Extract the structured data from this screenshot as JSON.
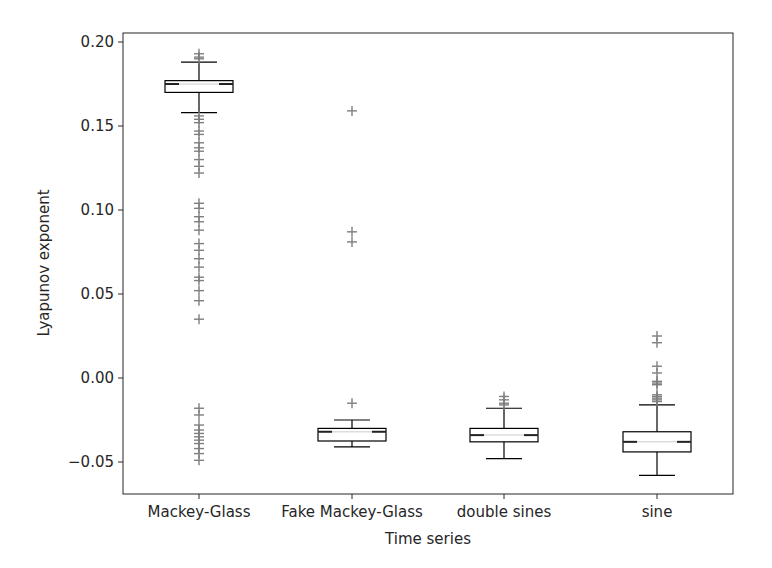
{
  "chart_data": {
    "type": "box",
    "title": "",
    "xlabel": "Time series",
    "ylabel": "Lyapunov exponent",
    "ylim": [
      -0.069,
      0.205
    ],
    "yticks": [
      0.2,
      0.15,
      0.1,
      0.05,
      0.0,
      -0.05
    ],
    "ytick_labels": [
      "0.20",
      "0.15",
      "0.10",
      "0.05",
      "0.00",
      "−0.05"
    ],
    "grid": false,
    "legend": null,
    "categories": [
      "Mackey-Glass",
      "Fake Mackey-Glass",
      "double sines",
      "sine"
    ],
    "series": [
      {
        "name": "Mackey-Glass",
        "whisker_low": 0.158,
        "q1": 0.17,
        "median": 0.175,
        "q3": 0.177,
        "whisker_high": 0.188,
        "outliers": [
          0.193,
          0.191,
          0.19,
          0.156,
          0.154,
          0.152,
          0.147,
          0.145,
          0.14,
          0.137,
          0.135,
          0.13,
          0.126,
          0.122,
          0.104,
          0.101,
          0.096,
          0.093,
          0.088,
          0.08,
          0.076,
          0.071,
          0.066,
          0.06,
          0.058,
          0.052,
          0.046,
          0.035,
          -0.018,
          -0.022,
          -0.028,
          -0.031,
          -0.033,
          -0.035,
          -0.037,
          -0.039,
          -0.042,
          -0.045,
          -0.049
        ]
      },
      {
        "name": "Fake Mackey-Glass",
        "whisker_low": -0.041,
        "q1": -0.0375,
        "median": -0.032,
        "q3": -0.03,
        "whisker_high": -0.025,
        "outliers": [
          0.159,
          0.087,
          0.081,
          -0.015
        ]
      },
      {
        "name": "double sines",
        "whisker_low": -0.048,
        "q1": -0.038,
        "median": -0.034,
        "q3": -0.03,
        "whisker_high": -0.018,
        "outliers": [
          -0.011,
          -0.013,
          -0.015,
          -0.016
        ]
      },
      {
        "name": "sine",
        "whisker_low": -0.058,
        "q1": -0.044,
        "median": -0.038,
        "q3": -0.032,
        "whisker_high": -0.016,
        "outliers": [
          0.025,
          0.021,
          0.007,
          0.003,
          -0.002,
          -0.003,
          -0.004,
          -0.01,
          -0.011,
          -0.012,
          -0.013,
          -0.014
        ]
      }
    ]
  },
  "style": {
    "box_color": "#000000",
    "median_color": "#dddddd",
    "outlier_color": "#7f7f7f",
    "frame_color": "#262626"
  }
}
